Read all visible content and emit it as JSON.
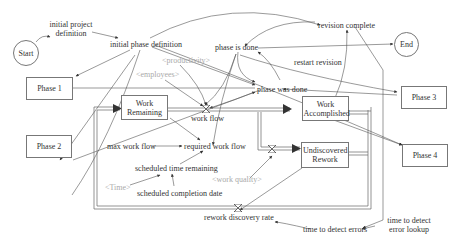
{
  "diagram": {
    "nodes": {
      "start": "Start",
      "end": "End",
      "initial_project_definition": "initial project definition",
      "initial_phase_definition": "initial phase definition",
      "revision_complete": "revision complete",
      "phase_is_done": "phase is done",
      "restart_revision": "restart revision",
      "phase_was_done": "phase was done",
      "productivity": "<productivity>",
      "employees": "<employees>",
      "work_flow": "work flow",
      "work_remaining": "Work Remaining",
      "work_accomplished": "Work Accomplished",
      "undiscovered_rework": "Undiscovered Rework",
      "max_work_flow": "max work flow",
      "required_work_flow": "required work flow",
      "scheduled_time_remaining": "scheduled time remaining",
      "time": "<Time>",
      "scheduled_completion_date": "scheduled completion date",
      "work_quality": "<work quality>",
      "rework_discovery_rate": "rework discovery rate",
      "time_to_detect_errors": "time to detect errors",
      "time_to_detect_error_lookup": "time to detect error lookup",
      "phase_1": "Phase 1",
      "phase_2": "Phase 2",
      "phase_3": "Phase 3",
      "phase_4": "Phase 4"
    },
    "colors": {
      "line": "#555555",
      "shadow_text": "#aaaaaa",
      "box_border": "#777777"
    }
  }
}
